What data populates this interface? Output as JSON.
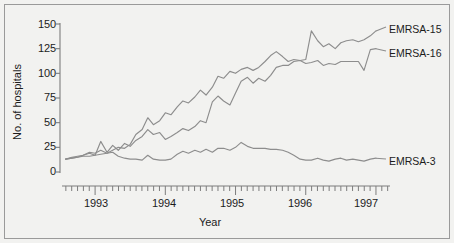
{
  "chart_data": {
    "type": "line",
    "title": "",
    "xlabel": "Year",
    "ylabel": "No. of hospitals",
    "ylim": [
      0,
      150
    ],
    "yticks": [
      0,
      25,
      50,
      75,
      100,
      125,
      150
    ],
    "xlim": [
      1992.5,
      1997.2
    ],
    "xticks": [
      1993,
      1994,
      1995,
      1996,
      1997
    ],
    "xtick_labels": [
      "1993",
      "1994",
      "1995",
      "1996",
      "1997"
    ],
    "x_minor_tick_interval_months": 1,
    "grid": false,
    "legend_position": "right-inline",
    "line_color": "#8d8d8d",
    "axis_color": "#7d7d7d",
    "background": "#f2f2f0",
    "series": [
      {
        "name": "EMRSA-15",
        "label": "EMRSA-15",
        "x": [
          1992.58,
          1992.67,
          1992.75,
          1992.83,
          1992.92,
          1993.0,
          1993.08,
          1993.17,
          1993.25,
          1993.33,
          1993.42,
          1993.5,
          1993.58,
          1993.67,
          1993.75,
          1993.83,
          1993.92,
          1994.0,
          1994.08,
          1994.17,
          1994.25,
          1994.33,
          1994.42,
          1994.5,
          1994.58,
          1994.67,
          1994.75,
          1994.83,
          1994.92,
          1995.0,
          1995.08,
          1995.17,
          1995.25,
          1995.33,
          1995.42,
          1995.5,
          1995.58,
          1995.67,
          1995.75,
          1995.83,
          1995.92,
          1996.0,
          1996.08,
          1996.17,
          1996.25,
          1996.33,
          1996.42,
          1996.5,
          1996.58,
          1996.67,
          1996.75,
          1996.83,
          1996.92,
          1997.0
        ],
        "y": [
          13,
          14,
          15,
          16,
          16,
          17,
          18,
          19,
          22,
          25,
          24,
          28,
          38,
          43,
          55,
          48,
          52,
          60,
          58,
          66,
          72,
          70,
          76,
          83,
          78,
          86,
          97,
          95,
          102,
          100,
          104,
          106,
          103,
          106,
          112,
          118,
          122,
          117,
          112,
          114,
          113,
          114,
          143,
          133,
          127,
          130,
          125,
          131,
          133,
          134,
          132,
          134,
          138,
          143
        ]
      },
      {
        "name": "EMRSA-16",
        "label": "EMRSA-16",
        "x": [
          1992.58,
          1992.67,
          1992.75,
          1992.83,
          1992.92,
          1993.0,
          1993.08,
          1993.17,
          1993.25,
          1993.33,
          1993.42,
          1993.5,
          1993.58,
          1993.67,
          1993.75,
          1993.83,
          1993.92,
          1994.0,
          1994.08,
          1994.17,
          1994.25,
          1994.33,
          1994.42,
          1994.5,
          1994.58,
          1994.67,
          1994.75,
          1994.83,
          1994.92,
          1995.0,
          1995.08,
          1995.17,
          1995.25,
          1995.33,
          1995.42,
          1995.5,
          1995.58,
          1995.67,
          1995.75,
          1995.83,
          1995.92,
          1996.0,
          1996.08,
          1996.17,
          1996.25,
          1996.33,
          1996.42,
          1996.5,
          1996.58,
          1996.67,
          1996.75,
          1996.83,
          1996.92,
          1997.0
        ],
        "y": [
          13,
          14,
          15,
          17,
          19,
          17,
          31,
          20,
          27,
          22,
          29,
          26,
          32,
          36,
          43,
          38,
          40,
          33,
          36,
          40,
          44,
          42,
          46,
          52,
          50,
          71,
          77,
          72,
          68,
          80,
          92,
          96,
          90,
          95,
          92,
          98,
          106,
          108,
          108,
          112,
          113,
          110,
          111,
          113,
          108,
          110,
          109,
          112,
          112,
          112,
          112,
          103,
          124,
          125
        ]
      },
      {
        "name": "EMRSA-3",
        "label": "EMRSA-3",
        "x": [
          1992.58,
          1992.67,
          1992.75,
          1992.83,
          1992.92,
          1993.0,
          1993.08,
          1993.17,
          1993.25,
          1993.33,
          1993.42,
          1993.5,
          1993.58,
          1993.67,
          1993.75,
          1993.83,
          1993.92,
          1994.0,
          1994.08,
          1994.17,
          1994.25,
          1994.33,
          1994.42,
          1994.5,
          1994.58,
          1994.67,
          1994.75,
          1994.83,
          1994.92,
          1995.0,
          1995.08,
          1995.17,
          1995.25,
          1995.33,
          1995.42,
          1995.5,
          1995.58,
          1995.67,
          1995.75,
          1995.83,
          1995.92,
          1996.0,
          1996.08,
          1996.17,
          1996.25,
          1996.33,
          1996.42,
          1996.5,
          1996.58,
          1996.67,
          1996.75,
          1996.83,
          1996.92,
          1997.0
        ],
        "y": [
          13,
          15,
          16,
          17,
          20,
          19,
          22,
          19,
          20,
          16,
          14,
          13,
          13,
          12,
          17,
          13,
          12,
          12,
          13,
          18,
          21,
          19,
          22,
          20,
          23,
          20,
          24,
          24,
          22,
          25,
          30,
          26,
          24,
          24,
          24,
          23,
          23,
          22,
          20,
          17,
          13,
          12,
          12,
          14,
          12,
          11,
          13,
          14,
          12,
          13,
          12,
          11,
          13,
          14
        ]
      }
    ]
  },
  "labels": {
    "emrsa15": "EMRSA-15",
    "emrsa16": "EMRSA-16",
    "emrsa3": "EMRSA-3",
    "ylabel": "No. of hospitals",
    "xlabel": "Year",
    "ytick_0": "0",
    "ytick_25": "25",
    "ytick_50": "50",
    "ytick_75": "75",
    "ytick_100": "100",
    "ytick_125": "125",
    "ytick_150": "150",
    "xtick_1993": "1993",
    "xtick_1994": "1994",
    "xtick_1995": "1995",
    "xtick_1996": "1996",
    "xtick_1997": "1997"
  }
}
